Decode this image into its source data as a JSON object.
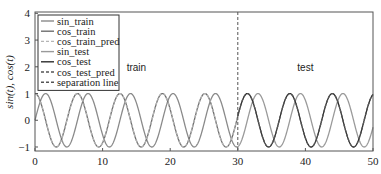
{
  "chart_data": {
    "type": "line",
    "title": "",
    "xlabel": "",
    "ylabel": "sin(t), cos(t)",
    "xlim": [
      0,
      50
    ],
    "ylim": [
      -1.15,
      4.05
    ],
    "xticks": [
      0,
      10,
      20,
      30,
      40,
      50
    ],
    "yticks": [
      -1,
      0,
      1,
      2,
      3,
      4
    ],
    "grid": false,
    "legend_position": "upper left",
    "separation_x": 30,
    "annotations": [
      {
        "text": "train",
        "x": 15,
        "y": 2.0
      },
      {
        "text": "test",
        "x": 40,
        "y": 2.0
      }
    ],
    "series": [
      {
        "name": "sin_train",
        "function": "sin",
        "x_range": [
          0,
          30
        ],
        "color": "#8a8a8a",
        "style": "solid"
      },
      {
        "name": "cos_train",
        "function": "cos",
        "x_range": [
          0,
          30
        ],
        "color": "#6e6e6e",
        "style": "solid"
      },
      {
        "name": "cos_train_pred",
        "function": "cos",
        "x_range": [
          0,
          30
        ],
        "color": "#b5b5b5",
        "style": "dashed"
      },
      {
        "name": "sin_test",
        "function": "sin",
        "x_range": [
          30,
          50
        ],
        "color": "#9a9a9a",
        "style": "solid"
      },
      {
        "name": "cos_test",
        "function": "cos",
        "x_range": [
          30,
          50
        ],
        "color": "#2e2e2e",
        "style": "solid"
      },
      {
        "name": "cos_test_pred",
        "function": "cos",
        "x_range": [
          30,
          50
        ],
        "color": "#555555",
        "style": "dashed"
      },
      {
        "name": "separation line",
        "function": "vline",
        "x_range": [
          30,
          30
        ],
        "color": "#555555",
        "style": "dashed"
      }
    ]
  },
  "legend": {
    "items": [
      {
        "label": "sin_train",
        "color": "#8a8a8a",
        "dash": ""
      },
      {
        "label": "cos_train",
        "color": "#6e6e6e",
        "dash": ""
      },
      {
        "label": "cos_train_pred",
        "color": "#b5b5b5",
        "dash": "3,2"
      },
      {
        "label": "sin_test",
        "color": "#9a9a9a",
        "dash": ""
      },
      {
        "label": "cos_test",
        "color": "#2e2e2e",
        "dash": ""
      },
      {
        "label": "cos_test_pred",
        "color": "#555555",
        "dash": "3,2"
      },
      {
        "label": "separation line",
        "color": "#555555",
        "dash": "3,2"
      }
    ]
  },
  "labels": {
    "ylabel": "sin(t), cos(t)",
    "train": "train",
    "test": "test"
  }
}
